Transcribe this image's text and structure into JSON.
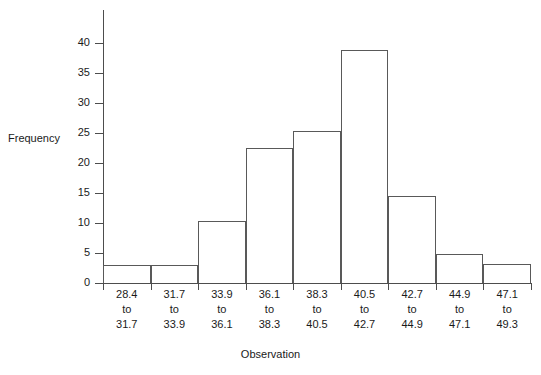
{
  "chart_data": {
    "type": "bar",
    "title": "",
    "subtitle": "",
    "xlabel": "Observation",
    "ylabel": "Frequency",
    "grid": false,
    "legend": null,
    "ylim": [
      0,
      45.5
    ],
    "yticks": [
      0,
      5,
      10,
      15,
      20,
      25,
      30,
      35,
      40
    ],
    "ytick_labels": [
      "0",
      "5",
      "10",
      "15",
      "20",
      "25",
      "30",
      "35",
      "40"
    ],
    "bin_edges": [
      28.4,
      31.7,
      33.9,
      36.1,
      38.3,
      40.5,
      42.7,
      44.9,
      47.1,
      49.3
    ],
    "categories": [
      "28.4 to 31.7",
      "31.7 to 33.9",
      "33.9 to 36.1",
      "36.1 to 38.3",
      "38.3 to 40.5",
      "40.5 to 42.7",
      "42.7 to 44.9",
      "44.9 to 47.1",
      "47.1 to 49.3"
    ],
    "tick_labels": [
      {
        "from": "28.4",
        "to_word": "to",
        "to": "31.7"
      },
      {
        "from": "31.7",
        "to_word": "to",
        "to": "33.9"
      },
      {
        "from": "33.9",
        "to_word": "to",
        "to": "36.1"
      },
      {
        "from": "36.1",
        "to_word": "to",
        "to": "38.3"
      },
      {
        "from": "38.3",
        "to_word": "to",
        "to": "40.5"
      },
      {
        "from": "40.5",
        "to_word": "to",
        "to": "42.7"
      },
      {
        "from": "42.7",
        "to_word": "to",
        "to": "44.9"
      },
      {
        "from": "44.9",
        "to_word": "to",
        "to": "47.1"
      },
      {
        "from": "47.1",
        "to_word": "to",
        "to": "49.3"
      }
    ],
    "values": [
      3,
      3,
      10.3,
      22.5,
      25.4,
      38.8,
      14.5,
      4.8,
      3.2
    ],
    "colors": {
      "bar_stroke": "#595959",
      "axis": "#4d4d4d",
      "text": "#1a1a1a",
      "background": "#ffffff"
    }
  }
}
